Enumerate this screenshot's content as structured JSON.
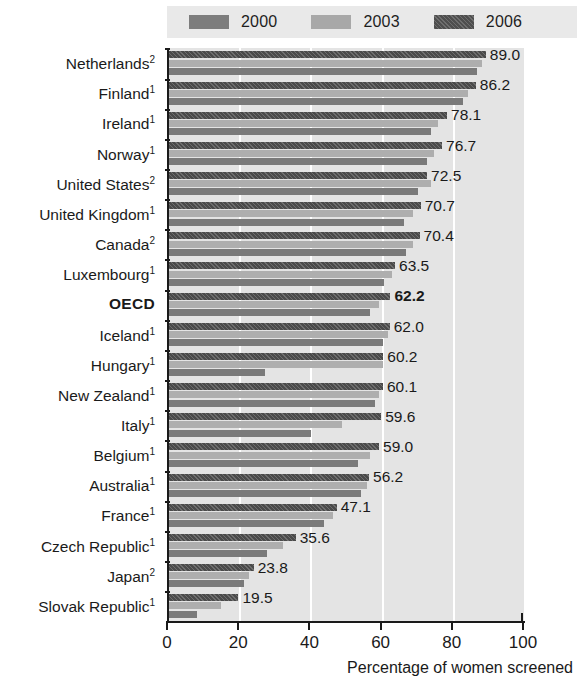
{
  "legend": {
    "items": [
      {
        "label": "2000",
        "icon": "legend-swatch-2000",
        "color": "#7d7d7d"
      },
      {
        "label": "2003",
        "icon": "legend-swatch-2003",
        "color": "#a8a8a8"
      },
      {
        "label": "2006",
        "icon": "legend-swatch-2006",
        "color": "#4f4f4f"
      }
    ]
  },
  "axis": {
    "x_title": "Percentage of women screened",
    "ticks": [
      "0",
      "20",
      "40",
      "60",
      "80",
      "100"
    ]
  },
  "chart_data": {
    "type": "bar",
    "orientation": "horizontal",
    "title": "",
    "xlabel": "Percentage of women screened",
    "ylabel": "",
    "xlim": [
      0,
      100
    ],
    "grid": true,
    "gridlines": [
      20,
      40,
      60,
      80,
      100
    ],
    "legend_position": "top",
    "categories": [
      "Netherlands²",
      "Finland¹",
      "Ireland¹",
      "Norway¹",
      "United States²",
      "United Kingdom¹",
      "Canada²",
      "Luxembourg¹",
      "OECD",
      "Iceland¹",
      "Hungary¹",
      "New Zealand¹",
      "Italy¹",
      "Belgium¹",
      "Australia¹",
      "France¹",
      "Czech Republic¹",
      "Japan²",
      "Slovak Republic¹"
    ],
    "category_parts": [
      {
        "name": "Netherlands",
        "note": "2",
        "bold": false
      },
      {
        "name": "Finland",
        "note": "1",
        "bold": false
      },
      {
        "name": "Ireland",
        "note": "1",
        "bold": false
      },
      {
        "name": "Norway",
        "note": "1",
        "bold": false
      },
      {
        "name": "United States",
        "note": "2",
        "bold": false
      },
      {
        "name": "United Kingdom",
        "note": "1",
        "bold": false
      },
      {
        "name": "Canada",
        "note": "2",
        "bold": false
      },
      {
        "name": "Luxembourg",
        "note": "1",
        "bold": false
      },
      {
        "name": "OECD",
        "note": "",
        "bold": true
      },
      {
        "name": "Iceland",
        "note": "1",
        "bold": false
      },
      {
        "name": "Hungary",
        "note": "1",
        "bold": false
      },
      {
        "name": "New Zealand",
        "note": "1",
        "bold": false
      },
      {
        "name": "Italy",
        "note": "1",
        "bold": false
      },
      {
        "name": "Belgium",
        "note": "1",
        "bold": false
      },
      {
        "name": "Australia",
        "note": "1",
        "bold": false
      },
      {
        "name": "France",
        "note": "1",
        "bold": false
      },
      {
        "name": "Czech Republic",
        "note": "1",
        "bold": false
      },
      {
        "name": "Japan",
        "note": "2",
        "bold": false
      },
      {
        "name": "Slovak Republic",
        "note": "1",
        "bold": false
      }
    ],
    "series": [
      {
        "name": "2006",
        "color": "#4a4a4a",
        "values": [
          89.0,
          86.2,
          78.1,
          76.7,
          72.5,
          70.7,
          70.4,
          63.5,
          62.2,
          62.0,
          60.2,
          60.1,
          59.6,
          59.0,
          56.2,
          47.1,
          35.6,
          23.8,
          19.5
        ]
      },
      {
        "name": "2003",
        "color": "#aeaeae",
        "values": [
          88.0,
          84.0,
          75.5,
          74.5,
          73.5,
          68.5,
          68.5,
          62.5,
          59.0,
          61.5,
          60.0,
          59.0,
          48.5,
          56.5,
          55.5,
          46.0,
          32.0,
          22.5,
          14.5
        ]
      },
      {
        "name": "2000",
        "color": "#7a7a7a",
        "values": [
          86.5,
          82.5,
          73.5,
          72.5,
          70.0,
          66.0,
          66.5,
          60.5,
          56.5,
          60.0,
          27.0,
          58.0,
          40.0,
          53.0,
          54.0,
          43.5,
          27.5,
          21.0,
          8.0
        ]
      }
    ],
    "value_labels": [
      "89.0",
      "86.2",
      "78.1",
      "76.7",
      "72.5",
      "70.7",
      "70.4",
      "63.5",
      "62.2",
      "62.0",
      "60.2",
      "60.1",
      "59.6",
      "59.0",
      "56.2",
      "47.1",
      "35.6",
      "23.8",
      "19.5"
    ],
    "value_label_bold_index": 8
  }
}
